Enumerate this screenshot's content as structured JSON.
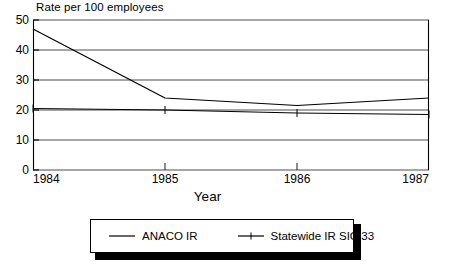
{
  "chart_data": {
    "type": "line",
    "title": "Rate per 100 employees",
    "xlabel": "Year",
    "ylabel": "",
    "x": [
      1984,
      1985,
      1986,
      1987
    ],
    "xticklabels": [
      "1984",
      "1985",
      "1986",
      "1987"
    ],
    "yticklabels": [
      "0",
      "10",
      "20",
      "30",
      "40",
      "50"
    ],
    "yticks": [
      0,
      10,
      20,
      30,
      40,
      50
    ],
    "xlim": [
      1984,
      1987
    ],
    "ylim": [
      0,
      50
    ],
    "grid": "horizontal",
    "legend_position": "below-plot",
    "series": [
      {
        "name": "ANACO IR",
        "marker": "none",
        "values": [
          47.0,
          24.0,
          21.5,
          24.0
        ]
      },
      {
        "name": "Statewide IR SIC 33",
        "marker": "tick",
        "values": [
          20.5,
          20.0,
          19.0,
          18.5
        ]
      }
    ]
  },
  "legend": {
    "entries": [
      {
        "label": "ANACO IR",
        "swatch": "plain-line-icon"
      },
      {
        "label": "Statewide IR SIC 33",
        "swatch": "line-with-marker-icon"
      }
    ]
  }
}
